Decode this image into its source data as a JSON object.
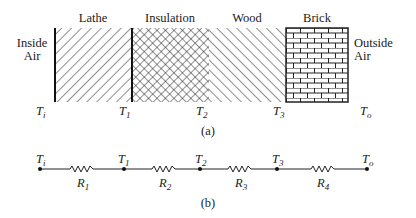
{
  "figure": {
    "part_a": {
      "caption": "(a)",
      "left_medium": {
        "line1": "Inside",
        "line2": "Air"
      },
      "right_medium": {
        "line1": "Outside",
        "line2": "Air"
      },
      "layers": [
        {
          "name": "Lathe",
          "pattern": "diagonal-forward-hatch"
        },
        {
          "name": "Insulation",
          "pattern": "cross-hatch"
        },
        {
          "name": "Wood",
          "pattern": "diagonal-back-hatch"
        },
        {
          "name": "Brick",
          "pattern": "brick"
        }
      ],
      "temperatures": [
        {
          "base": "T",
          "sub": "i"
        },
        {
          "base": "T",
          "sub": "1"
        },
        {
          "base": "T",
          "sub": "2"
        },
        {
          "base": "T",
          "sub": "3"
        },
        {
          "base": "T",
          "sub": "o"
        }
      ]
    },
    "part_b": {
      "caption": "(b)",
      "nodes": [
        {
          "base": "T",
          "sub": "i"
        },
        {
          "base": "T",
          "sub": "1"
        },
        {
          "base": "T",
          "sub": "2"
        },
        {
          "base": "T",
          "sub": "3"
        },
        {
          "base": "T",
          "sub": "o"
        }
      ],
      "resistors": [
        {
          "base": "R",
          "sub": "1"
        },
        {
          "base": "R",
          "sub": "2"
        },
        {
          "base": "R",
          "sub": "3"
        },
        {
          "base": "R",
          "sub": "4"
        }
      ]
    }
  }
}
